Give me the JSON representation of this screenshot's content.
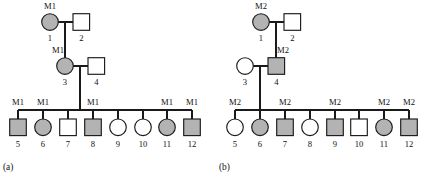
{
  "figure": {
    "type": "pedigree-chart-pair",
    "colors": {
      "affected_fill": "#b3b3b3",
      "unaffected_fill": "#ffffff",
      "stroke": "#1a1a1a",
      "text": "#111111",
      "background": "#ffffff"
    }
  },
  "panels": [
    {
      "key": "a",
      "label": "(a)",
      "marker_name": "M1",
      "generations": [
        {
          "level": "I",
          "individuals": [
            {
              "id": "1",
              "shape": "circle",
              "sex": "female",
              "fill": "shaded",
              "marker": "M1"
            },
            {
              "id": "2",
              "shape": "square",
              "sex": "male",
              "fill": "open",
              "marker": ""
            }
          ]
        },
        {
          "level": "II",
          "individuals": [
            {
              "id": "3",
              "shape": "circle",
              "sex": "female",
              "fill": "shaded",
              "marker": "M1"
            },
            {
              "id": "4",
              "shape": "square",
              "sex": "male",
              "fill": "open",
              "marker": ""
            }
          ]
        },
        {
          "level": "III",
          "individuals": [
            {
              "id": "5",
              "shape": "square",
              "sex": "male",
              "fill": "shaded",
              "marker": "M1"
            },
            {
              "id": "6",
              "shape": "circle",
              "sex": "female",
              "fill": "shaded",
              "marker": "M1"
            },
            {
              "id": "7",
              "shape": "square",
              "sex": "male",
              "fill": "open",
              "marker": ""
            },
            {
              "id": "8",
              "shape": "square",
              "sex": "male",
              "fill": "shaded",
              "marker": "M1"
            },
            {
              "id": "9",
              "shape": "circle",
              "sex": "female",
              "fill": "open",
              "marker": ""
            },
            {
              "id": "10",
              "shape": "circle",
              "sex": "female",
              "fill": "open",
              "marker": ""
            },
            {
              "id": "11",
              "shape": "circle",
              "sex": "female",
              "fill": "shaded",
              "marker": "M1"
            },
            {
              "id": "12",
              "shape": "square",
              "sex": "male",
              "fill": "shaded",
              "marker": "M1"
            }
          ]
        }
      ]
    },
    {
      "key": "b",
      "label": "(b)",
      "marker_name": "M2",
      "generations": [
        {
          "level": "I",
          "individuals": [
            {
              "id": "1",
              "shape": "circle",
              "sex": "female",
              "fill": "shaded",
              "marker": "M2"
            },
            {
              "id": "2",
              "shape": "square",
              "sex": "male",
              "fill": "open",
              "marker": ""
            }
          ]
        },
        {
          "level": "II",
          "individuals": [
            {
              "id": "3",
              "shape": "circle",
              "sex": "female",
              "fill": "open",
              "marker": ""
            },
            {
              "id": "4",
              "shape": "square",
              "sex": "male",
              "fill": "shaded",
              "marker": "M2"
            }
          ]
        },
        {
          "level": "III",
          "individuals": [
            {
              "id": "5",
              "shape": "circle",
              "sex": "female",
              "fill": "open",
              "marker": "M2"
            },
            {
              "id": "6",
              "shape": "circle",
              "sex": "female",
              "fill": "shaded",
              "marker": ""
            },
            {
              "id": "7",
              "shape": "square",
              "sex": "male",
              "fill": "shaded",
              "marker": "M2"
            },
            {
              "id": "8",
              "shape": "circle",
              "sex": "female",
              "fill": "open",
              "marker": ""
            },
            {
              "id": "9",
              "shape": "square",
              "sex": "male",
              "fill": "shaded",
              "marker": "M2"
            },
            {
              "id": "10",
              "shape": "square",
              "sex": "male",
              "fill": "open",
              "marker": ""
            },
            {
              "id": "11",
              "shape": "circle",
              "sex": "female",
              "fill": "shaded",
              "marker": "M2"
            },
            {
              "id": "12",
              "shape": "square",
              "sex": "male",
              "fill": "shaded",
              "marker": "M2"
            }
          ]
        }
      ]
    }
  ]
}
